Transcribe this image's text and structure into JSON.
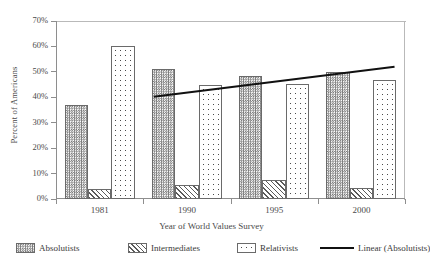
{
  "chart_data": {
    "type": "bar",
    "title": "",
    "xlabel": "Year of World Values Survey",
    "ylabel": "Percent of Americans",
    "categories": [
      "1981",
      "1990",
      "1995",
      "2000"
    ],
    "ylim": [
      0,
      70
    ],
    "ytick_labels": [
      "0%",
      "10%",
      "20%",
      "30%",
      "40%",
      "50%",
      "60%",
      "70%"
    ],
    "ytick_values": [
      0,
      10,
      20,
      30,
      40,
      50,
      60,
      70
    ],
    "grid": false,
    "legend_position": "bottom",
    "series": [
      {
        "name": "Absolutists",
        "pattern": "checkerboard",
        "values": [
          37.0,
          51.0,
          48.5,
          50.0
        ]
      },
      {
        "name": "Intermediates",
        "pattern": "diagonal-hatch",
        "values": [
          4.0,
          5.5,
          7.3,
          4.5
        ]
      },
      {
        "name": "Relativists",
        "pattern": "dotted",
        "values": [
          60.2,
          45.0,
          45.3,
          47.0
        ]
      }
    ],
    "trendline": {
      "name": "Linear (Absolutists)",
      "start": {
        "x": 0.62,
        "y": 40.2
      },
      "end": {
        "x": 3.38,
        "y": 52.0
      },
      "color": "#111111"
    }
  },
  "legend": {
    "items": [
      {
        "label": "Absolutists",
        "swatch": "checkerboard-swatch"
      },
      {
        "label": "Intermediates",
        "swatch": "hatch-swatch"
      },
      {
        "label": "Relativists",
        "swatch": "dotted-swatch"
      },
      {
        "label": "Linear (Absolutists)",
        "swatch": "line-swatch"
      }
    ]
  }
}
